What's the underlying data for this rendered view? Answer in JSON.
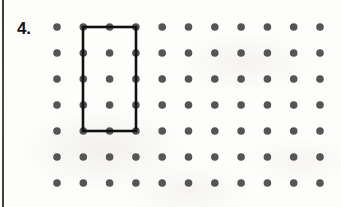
{
  "page": {
    "width": 341,
    "height": 207,
    "background_color": "#fdfdfc",
    "margin_rule_color": "#3f3f3f"
  },
  "item": {
    "number_label": "4."
  },
  "dot_grid": {
    "columns": 11,
    "rows": 7,
    "origin_x": 57,
    "origin_y": 27,
    "spacing_x": 26.3,
    "spacing_y": 26,
    "dot_radius": 3.8,
    "dot_color": "#555555"
  },
  "shape": {
    "kind": "rectangle",
    "stroke_color": "#111111",
    "stroke_width": 2.6,
    "col_start": 1,
    "col_end": 3,
    "row_start": 0,
    "row_end": 4,
    "x": 83,
    "y": 27,
    "width": 53,
    "height": 104,
    "width_units": 2,
    "height_units": 4
  }
}
